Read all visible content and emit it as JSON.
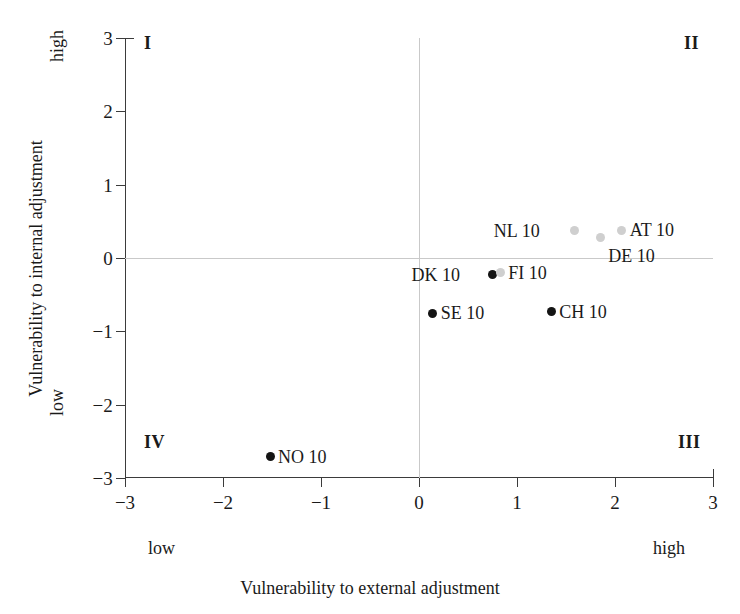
{
  "chart_data": {
    "type": "scatter",
    "title": "",
    "xlabel": "Vulnerability to external adjustment",
    "ylabel": "Vulnerability to internal adjustment",
    "xlim": [
      -3,
      3
    ],
    "ylim": [
      -3,
      3
    ],
    "xticks": [
      "−3",
      "−2",
      "−1",
      "0",
      "1",
      "2",
      "3"
    ],
    "xtick_values": [
      -3,
      -2,
      -1,
      0,
      1,
      2,
      3
    ],
    "yticks": [
      "−3",
      "−2",
      "−1",
      "0",
      "1",
      "2",
      "3"
    ],
    "ytick_values": [
      -3,
      -2,
      -1,
      0,
      1,
      2,
      3
    ],
    "grid": false,
    "zero_reference_lines": true,
    "legend": "none",
    "x_axis_anchors": {
      "low": "low",
      "high": "high"
    },
    "y_axis_anchors": {
      "low": "low",
      "high": "high"
    },
    "quadrant_labels": [
      {
        "id": "I",
        "label": "I",
        "position": "top-left"
      },
      {
        "id": "II",
        "label": "II",
        "position": "top-right"
      },
      {
        "id": "III",
        "label": "III",
        "position": "bottom-right"
      },
      {
        "id": "IV",
        "label": "IV",
        "position": "bottom-left"
      }
    ],
    "points": [
      {
        "label": "NO 10",
        "x": -1.52,
        "y": -2.71,
        "color": "#141414",
        "shade": "dark",
        "label_side": "right"
      },
      {
        "label": "SE 10",
        "x": 0.14,
        "y": -0.75,
        "color": "#141414",
        "shade": "dark",
        "label_side": "right"
      },
      {
        "label": "DK 10",
        "x": 0.75,
        "y": -0.23,
        "color": "#141414",
        "shade": "dark",
        "label_side": "left"
      },
      {
        "label": "FI 10",
        "x": 0.83,
        "y": -0.2,
        "color": "#cfcfcf",
        "shade": "light",
        "label_side": "right"
      },
      {
        "label": "CH 10",
        "x": 1.35,
        "y": -0.73,
        "color": "#141414",
        "shade": "dark",
        "label_side": "right"
      },
      {
        "label": "NL 10",
        "x": 1.59,
        "y": 0.37,
        "color": "#cfcfcf",
        "shade": "light",
        "label_side": "left"
      },
      {
        "label": "DE 10",
        "x": 1.85,
        "y": 0.28,
        "color": "#cfcfcf",
        "shade": "light",
        "label_side": "below"
      },
      {
        "label": "AT 10",
        "x": 2.07,
        "y": 0.38,
        "color": "#cfcfcf",
        "shade": "light",
        "label_side": "right"
      }
    ]
  }
}
